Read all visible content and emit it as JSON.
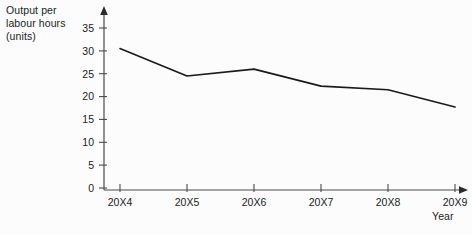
{
  "chart_data": {
    "type": "line",
    "title": "",
    "ylabel": "Output per\nlabour hours\n(units)",
    "xlabel": "Year",
    "categories": [
      "20X4",
      "20X5",
      "20X6",
      "20X7",
      "20X8",
      "20X9"
    ],
    "values": [
      30.5,
      24.5,
      26.0,
      22.3,
      21.5,
      17.7
    ],
    "series": [
      {
        "name": "Output per labour hours",
        "values": [
          30.5,
          24.5,
          26.0,
          22.3,
          21.5,
          17.7
        ]
      }
    ],
    "ylim": [
      0,
      35
    ],
    "yticks": [
      0,
      5,
      10,
      15,
      20,
      25,
      30,
      35
    ],
    "ytick_labels": [
      "0",
      "5",
      "10",
      "15",
      "20",
      "25",
      "30",
      "35"
    ],
    "grid": false,
    "legend": false,
    "legend_position": "none",
    "line_color": "#1a1a1a",
    "axis_color": "#4a4a4a",
    "background_color": "#fcfcfc",
    "markers": false,
    "axis_arrows": true
  },
  "labels": {
    "y_axis_line1": "Output per",
    "y_axis_line2": "labour hours",
    "y_axis_line3": "(units)",
    "x_axis_title": "Year"
  }
}
